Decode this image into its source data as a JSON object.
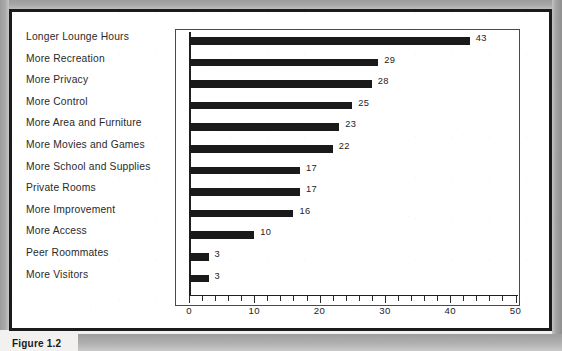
{
  "figure": {
    "caption": "Figure 1.2",
    "frame_color": "#1b1b1b",
    "background_color": "#ffffff"
  },
  "chart_data": {
    "type": "bar",
    "orientation": "horizontal",
    "title": "",
    "subtitle": "",
    "xlabel": "",
    "ylabel": "",
    "xlim": [
      0,
      52
    ],
    "grid": false,
    "legend": false,
    "bar_color": "#1a1a1a",
    "show_value_labels": true,
    "x_ticks_major": [
      0,
      10,
      20,
      30,
      40,
      50
    ],
    "x_tick_labels": [
      "0",
      "10",
      "20",
      "30",
      "40",
      "50"
    ],
    "x_tick_minor_step": 2,
    "categories": [
      "Longer Lounge Hours",
      "More Recreation",
      "More Privacy",
      "More Control",
      "More Area and Furniture",
      "More Movies and Games",
      "More School and Supplies",
      "Private Rooms",
      "More Improvement",
      "More Access",
      "Peer Roommates",
      "More Visitors"
    ],
    "values": [
      43,
      29,
      28,
      25,
      23,
      22,
      17,
      17,
      16,
      10,
      3,
      3
    ],
    "value_labels": [
      "43",
      "29",
      "28",
      "25",
      "23",
      "22",
      "17",
      "17",
      "16",
      "10",
      "3",
      "3"
    ]
  }
}
